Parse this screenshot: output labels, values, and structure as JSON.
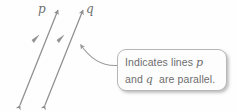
{
  "figure": {
    "name": "parallel-lines-diagram",
    "background_color": "#fefefe",
    "stroke_color": "#8f8f8f",
    "text_color": "#6d6d6d",
    "border_color": "#b7b7b7"
  },
  "lines": [
    {
      "label": "p",
      "name": "line-p",
      "x1": 20,
      "y1": 105,
      "x2": 58,
      "y2": 10,
      "tick_marks": 1,
      "double_arrow": true,
      "label_x": 38,
      "label_y": 3
    },
    {
      "label": "q",
      "name": "line-q",
      "x1": 45,
      "y1": 105,
      "x2": 83,
      "y2": 10,
      "tick_marks": 1,
      "double_arrow": true,
      "label_x": 86,
      "label_y": 3
    }
  ],
  "callout": {
    "text_full": "Indicates lines p and q are parallel.",
    "line1_before": "Indicates lines",
    "line1_italic": "p",
    "line2_before": "and",
    "line2_italic": "q",
    "line2_after": "are parallel.",
    "box": {
      "x": 117,
      "y": 49,
      "width": 110,
      "height": 42
    }
  },
  "leader": {
    "name": "callout-leader-line",
    "from_x": 117,
    "from_y": 65,
    "to_x": 77,
    "to_y": 41,
    "arrowhead": true
  }
}
